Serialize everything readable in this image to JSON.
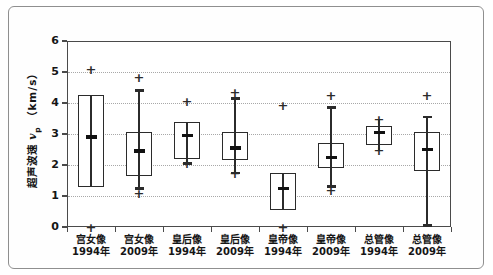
{
  "colors": {
    "ink": "#2b2b2b",
    "grid_dotted": "#a8a8a8",
    "plot_border": "#4a4a4a",
    "outer_frame": "#8f8f8f",
    "background": "#ffffff"
  },
  "chart_data": {
    "type": "boxplot",
    "title": "",
    "ylabel": {
      "prefix": "超声波速",
      "variable": "v",
      "subscript": "p",
      "unit": "（km/s）"
    },
    "ylabel_full": "超声波速 vp（km/s）",
    "ylim": [
      0,
      6
    ],
    "yticks": [
      0,
      1,
      2,
      3,
      4,
      5,
      6
    ],
    "grid": "horizontal dotted lines at y=1..5",
    "legend": "none",
    "marker_legend": {
      "plus": "outlier point",
      "thick_dash": "mean / whisker cap"
    },
    "boxes": [
      {
        "category": "宫女像",
        "year": "1994年",
        "box": [
          1.3,
          4.25
        ],
        "mean": 2.9,
        "line": [
          1.3,
          4.25
        ],
        "caps": [],
        "outliers": [
          5.1,
          0
        ]
      },
      {
        "category": "宫女像",
        "year": "2009年",
        "box": [
          1.65,
          3.05
        ],
        "mean": 2.45,
        "line": [
          1.25,
          4.4
        ],
        "caps": [
          1.25,
          4.4
        ],
        "outliers": [
          4.85,
          1.1
        ]
      },
      {
        "category": "皇后像",
        "year": "1994年",
        "box": [
          2.2,
          3.4
        ],
        "mean": 2.95,
        "line": [
          2.05,
          3.4
        ],
        "caps": [
          2.05
        ],
        "outliers": [
          4.05,
          2.05
        ]
      },
      {
        "category": "皇后像",
        "year": "2009年",
        "box": [
          2.15,
          3.05
        ],
        "mean": 2.55,
        "line": [
          1.75,
          4.15
        ],
        "caps": [
          1.75,
          4.15
        ],
        "outliers": [
          4.35,
          1.75
        ]
      },
      {
        "category": "皇帝像",
        "year": "1994年",
        "box": [
          0.55,
          1.75
        ],
        "mean": 1.25,
        "line": [
          0.55,
          1.75
        ],
        "caps": [],
        "outliers": [
          3.95,
          0
        ]
      },
      {
        "category": "皇帝像",
        "year": "2009年",
        "box": [
          1.9,
          2.7
        ],
        "mean": 2.25,
        "line": [
          1.3,
          3.85
        ],
        "caps": [
          1.3,
          3.85
        ],
        "outliers": [
          4.25,
          1.2
        ]
      },
      {
        "category": "总管像",
        "year": "1994年",
        "box": [
          2.65,
          3.25
        ],
        "mean": 3.05,
        "line": [
          2.5,
          3.5
        ],
        "caps": [],
        "outliers": [
          3.5,
          2.5
        ]
      },
      {
        "category": "总管像",
        "year": "2009年",
        "box": [
          1.8,
          3.05
        ],
        "mean": 2.5,
        "line": [
          0.05,
          3.55
        ],
        "caps": [
          0.05,
          3.55
        ],
        "outliers": [
          4.25
        ]
      }
    ]
  }
}
